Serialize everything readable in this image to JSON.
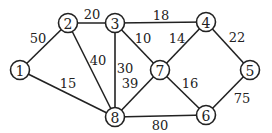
{
  "graph": {
    "nodes": [
      {
        "id": "1",
        "x": 20,
        "y": 70
      },
      {
        "id": "2",
        "x": 68,
        "y": 23
      },
      {
        "id": "3",
        "x": 115,
        "y": 23
      },
      {
        "id": "4",
        "x": 206,
        "y": 22
      },
      {
        "id": "5",
        "x": 250,
        "y": 70
      },
      {
        "id": "6",
        "x": 206,
        "y": 115
      },
      {
        "id": "7",
        "x": 160,
        "y": 70
      },
      {
        "id": "8",
        "x": 115,
        "y": 117
      }
    ],
    "edges": [
      {
        "from": "1",
        "to": "2",
        "weight": "50",
        "lx": 38,
        "ly": 38
      },
      {
        "from": "2",
        "to": "3",
        "weight": "20",
        "lx": 92,
        "ly": 14
      },
      {
        "from": "3",
        "to": "4",
        "weight": "18",
        "lx": 161,
        "ly": 15
      },
      {
        "from": "4",
        "to": "5",
        "weight": "22",
        "lx": 237,
        "ly": 37
      },
      {
        "from": "1",
        "to": "8",
        "weight": "15",
        "lx": 68,
        "ly": 83
      },
      {
        "from": "2",
        "to": "8",
        "weight": "40",
        "lx": 98,
        "ly": 60
      },
      {
        "from": "3",
        "to": "8",
        "weight": "30",
        "lx": 125,
        "ly": 68
      },
      {
        "from": "3",
        "to": "7",
        "weight": "10",
        "lx": 143,
        "ly": 38
      },
      {
        "from": "7",
        "to": "4",
        "weight": "14",
        "lx": 177,
        "ly": 38
      },
      {
        "from": "7",
        "to": "8",
        "weight": "39",
        "lx": 130,
        "ly": 83
      },
      {
        "from": "7",
        "to": "6",
        "weight": "16",
        "lx": 190,
        "ly": 83
      },
      {
        "from": "8",
        "to": "6",
        "weight": "80",
        "lx": 160,
        "ly": 125
      },
      {
        "from": "6",
        "to": "5",
        "weight": "75",
        "lx": 242,
        "ly": 98
      }
    ]
  }
}
